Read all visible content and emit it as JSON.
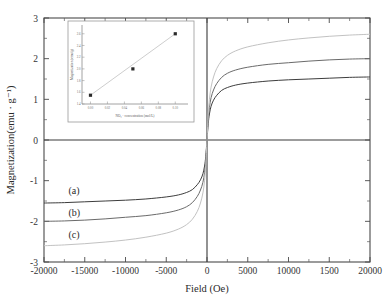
{
  "chart_data": {
    "type": "line",
    "title": "",
    "xlabel": "Field (Oe)",
    "ylabel": "Magnetization(emu · g⁻¹)",
    "xlim": [
      -20000,
      20000
    ],
    "ylim": [
      -3,
      3
    ],
    "xticks": [
      -20000,
      -15000,
      -10000,
      -5000,
      0,
      5000,
      10000,
      15000,
      20000
    ],
    "xticklabels": [
      "-20000",
      "-15000",
      "-10000",
      "-5000",
      "0",
      "5000",
      "10000",
      "1500",
      "20000"
    ],
    "yticks": [
      -3,
      -2,
      -1,
      0,
      1,
      2,
      3
    ],
    "yticklabels": [
      "-3",
      "-2",
      "-1",
      "0",
      "1",
      "2",
      "3"
    ],
    "grid": false,
    "legend_position": "inline-annotations",
    "series": [
      {
        "name": "(a)",
        "label": "(a)",
        "color": "#3d3d3d",
        "saturation": 1.55,
        "approach_field": 1400,
        "x": [
          -20000,
          -17500,
          -15000,
          -12500,
          -10000,
          -7500,
          -5000,
          -3500,
          -2500,
          -1800,
          -1200,
          -800,
          -500,
          -300,
          -150,
          0,
          150,
          300,
          500,
          800,
          1200,
          1800,
          2500,
          3500,
          5000,
          7500,
          10000,
          12500,
          15000,
          17500,
          20000
        ],
        "y": [
          -1.55,
          -1.54,
          -1.52,
          -1.5,
          -1.48,
          -1.45,
          -1.4,
          -1.35,
          -1.29,
          -1.22,
          -1.1,
          -0.98,
          -0.83,
          -0.64,
          -0.4,
          0.0,
          0.4,
          0.64,
          0.83,
          0.98,
          1.1,
          1.22,
          1.29,
          1.35,
          1.4,
          1.45,
          1.48,
          1.5,
          1.52,
          1.54,
          1.55
        ]
      },
      {
        "name": "(b)",
        "label": "(b)",
        "color": "#6a6a6a",
        "saturation": 2.0,
        "approach_field": 1700,
        "x": [
          -20000,
          -17500,
          -15000,
          -12500,
          -10000,
          -7500,
          -5000,
          -3500,
          -2500,
          -1800,
          -1200,
          -800,
          -500,
          -300,
          -150,
          0,
          150,
          300,
          500,
          800,
          1200,
          1800,
          2500,
          3500,
          5000,
          7500,
          10000,
          12500,
          15000,
          17500,
          20000
        ],
        "y": [
          -2.0,
          -1.99,
          -1.97,
          -1.94,
          -1.9,
          -1.86,
          -1.79,
          -1.72,
          -1.64,
          -1.54,
          -1.39,
          -1.23,
          -1.04,
          -0.8,
          -0.5,
          0.0,
          0.5,
          0.8,
          1.04,
          1.23,
          1.39,
          1.54,
          1.64,
          1.72,
          1.79,
          1.86,
          1.9,
          1.94,
          1.97,
          1.99,
          2.0
        ]
      },
      {
        "name": "(c)",
        "label": "(c)",
        "color": "#c2c2c2",
        "saturation": 2.6,
        "approach_field": 2100,
        "x": [
          -20000,
          -17500,
          -15000,
          -12500,
          -10000,
          -7500,
          -5000,
          -3500,
          -2500,
          -1800,
          -1200,
          -800,
          -500,
          -300,
          -150,
          0,
          150,
          300,
          500,
          800,
          1200,
          1800,
          2500,
          3500,
          5000,
          7500,
          10000,
          12500,
          15000,
          17500,
          20000
        ],
        "y": [
          -2.6,
          -2.58,
          -2.55,
          -2.51,
          -2.46,
          -2.39,
          -2.29,
          -2.19,
          -2.08,
          -1.95,
          -1.76,
          -1.55,
          -1.3,
          -1.0,
          -0.62,
          0.0,
          0.62,
          1.0,
          1.3,
          1.55,
          1.76,
          1.95,
          2.08,
          2.19,
          2.29,
          2.39,
          2.46,
          2.51,
          2.55,
          2.58,
          2.6
        ]
      }
    ],
    "annotations": [
      {
        "text": "(a)",
        "x": -17000,
        "y": -1.32
      },
      {
        "text": "(b)",
        "x": -17000,
        "y": -1.86
      },
      {
        "text": "(c)",
        "x": -17000,
        "y": -2.42
      }
    ],
    "inset": {
      "type": "scatter",
      "xlabel": "NO₃⁻ concentration (mol/L)",
      "ylabel": "Magnetization (emu/g)",
      "xlim": [
        -0.01,
        0.115
      ],
      "ylim": [
        1.4,
        2.75
      ],
      "xticks": [
        0.0,
        0.02,
        0.04,
        0.06,
        0.08,
        0.1
      ],
      "xticklabels": [
        "0.00",
        "0.02",
        "0.04",
        "0.06",
        "0.08",
        "0.10"
      ],
      "yticks": [
        1.4,
        1.6,
        1.8,
        2.0,
        2.2,
        2.4,
        2.6
      ],
      "yticklabels": [
        "1.4",
        "1.6",
        "1.8",
        "2.0",
        "2.2",
        "2.4",
        "2.6"
      ],
      "points": [
        {
          "x": 0.0,
          "y": 1.55
        },
        {
          "x": 0.05,
          "y": 2.0
        },
        {
          "x": 0.1,
          "y": 2.6
        }
      ],
      "trendline": [
        {
          "x": 0.0,
          "y": 1.55
        },
        {
          "x": 0.1,
          "y": 2.6
        }
      ]
    }
  }
}
